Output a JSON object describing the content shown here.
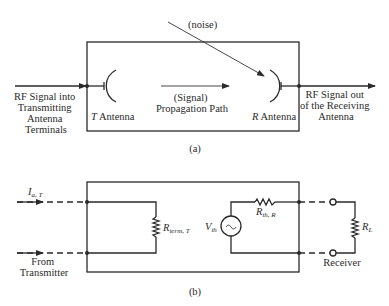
{
  "figure": {
    "part_a": {
      "caption": "(a)",
      "input_label": [
        "RF Signal into",
        "Transmitting",
        "Antenna",
        "Terminals"
      ],
      "output_label": [
        "RF Signal out",
        "of the Receiving",
        "Antenna"
      ],
      "transmit_antenna_label_var": "T",
      "transmit_antenna_label": " Antenna",
      "receive_antenna_label_var": "R",
      "receive_antenna_label": " Antenna",
      "propagation_label": [
        "(Signal)",
        "Propagation Path"
      ],
      "noise_label": "(noise)"
    },
    "part_b": {
      "caption": "(b)",
      "current_label_main": "I",
      "current_label_sub": "a, T",
      "source_label": [
        "From",
        "Transmitter"
      ],
      "term_resistor_main": "R",
      "term_resistor_sub": "term, T",
      "thevenin_resistor_main": "R",
      "thevenin_resistor_sub": "th, R",
      "thevenin_voltage_main": "V",
      "thevenin_voltage_sub": "th",
      "load_resistor_main": "R",
      "load_resistor_sub": "L",
      "receiver_label": "Receiver",
      "source_symbol": "~"
    }
  }
}
